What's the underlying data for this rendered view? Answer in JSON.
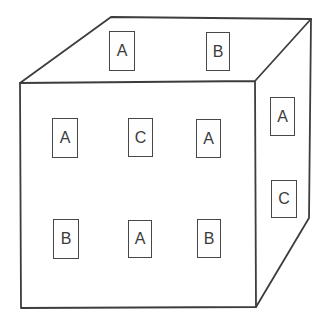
{
  "diagram": {
    "line_color": "#3d3d3d",
    "background_color": "#ffffff",
    "card_border_color": "#474747",
    "faces": {
      "top": {
        "labels": [
          "A",
          "B"
        ]
      },
      "front": {
        "labels": [
          "A",
          "C",
          "A",
          "B",
          "A",
          "B"
        ]
      },
      "right": {
        "labels": [
          "A",
          "C"
        ]
      }
    }
  }
}
